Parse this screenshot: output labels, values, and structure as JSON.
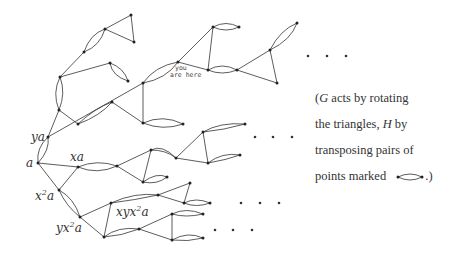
{
  "labels": {
    "a": "a",
    "ya": "ya",
    "xa": "xa",
    "x2a_base": "x",
    "x2a_exp": "2",
    "x2a_tail": "a",
    "yx2a_base": "yx",
    "yx2a_exp": "2",
    "yx2a_tail": "a",
    "xyx2a_base": "xyx",
    "xyx2a_exp": "2",
    "xyx2a_tail": "a",
    "you_are_here_1": "you",
    "you_are_here_2": "are here"
  },
  "ellipsis": "· · ·",
  "caption": {
    "open": "(",
    "G": "G",
    "line1_rest": " acts by rotating",
    "line2_start": "the triangles, ",
    "H": "H",
    "line2_rest": " by",
    "line3": "transposing pairs of",
    "line4": "points marked",
    "close": ".)"
  }
}
